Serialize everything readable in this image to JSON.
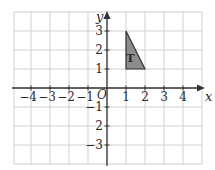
{
  "diagram": {
    "type": "coordinate-grid",
    "axes": {
      "x_label": "x",
      "y_label": "y",
      "origin_label": "O",
      "x_range": [
        -5,
        5
      ],
      "y_range": [
        -4,
        4
      ]
    },
    "x_ticks": [
      {
        "value": -4,
        "label": "−4"
      },
      {
        "value": -3,
        "label": "−3"
      },
      {
        "value": -2,
        "label": "−2"
      },
      {
        "value": -1,
        "label": "−1"
      },
      {
        "value": 1,
        "label": "1"
      },
      {
        "value": 2,
        "label": "2"
      },
      {
        "value": 3,
        "label": "3"
      },
      {
        "value": 4,
        "label": "4"
      }
    ],
    "y_ticks": [
      {
        "value": 3,
        "label": "3"
      },
      {
        "value": 2,
        "label": "2"
      },
      {
        "value": 1,
        "label": "1"
      },
      {
        "value": -1,
        "label": "−1"
      },
      {
        "value": -2,
        "label": "2"
      },
      {
        "value": -3,
        "label": "−3"
      }
    ],
    "shapes": [
      {
        "name": "T",
        "label": "T",
        "vertices": [
          [
            1,
            3
          ],
          [
            1,
            1
          ],
          [
            2,
            1
          ]
        ],
        "fill": "#8c8c8c",
        "stroke": "#333333"
      }
    ],
    "colors": {
      "grid": "#cfcfcf",
      "axis": "#333333",
      "background": "#ffffff"
    }
  }
}
